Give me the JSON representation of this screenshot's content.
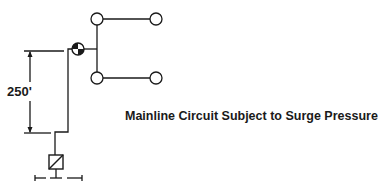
{
  "diagram": {
    "caption": "Mainline Circuit Subject to Surge Pressure",
    "dimension_label": "250'",
    "colors": {
      "line": "#1a1a1a",
      "background": "#ffffff"
    },
    "elements": [
      {
        "type": "valve",
        "label": "control-valve",
        "position": "junction"
      },
      {
        "type": "sprinkler-head",
        "count": 4
      },
      {
        "type": "backflow-device",
        "label": "meter/backflow box"
      },
      {
        "type": "dimension",
        "value": "250'"
      }
    ]
  }
}
